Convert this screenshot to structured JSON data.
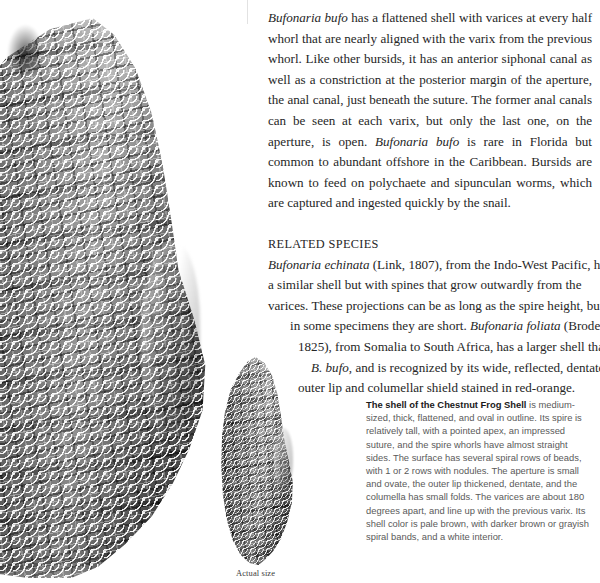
{
  "page": {
    "background_color": "#ffffff",
    "body_text_color": "#262626",
    "caption_text_color": "#5a5a5a",
    "caption_lead_color": "#1a1a1a"
  },
  "images": {
    "large_shell": {
      "name": "enlarged-shell-photograph",
      "subject": "Bufonaria bufo shell, enlarged grayscale photograph"
    },
    "small_shell": {
      "name": "actual-size-shell-photograph",
      "subject": "Bufonaria bufo shell at actual size, grayscale photograph"
    },
    "actual_size_label": "Actual size"
  },
  "body": {
    "paragraph_1": "Bufonaria bufo has a flattened shell with varices at every half whorl that are nearly aligned with the varix from the previous whorl. Like other bursids, it has an anterior siphonal canal as well as a constriction at the posterior margin of the aperture, the anal canal, just beneath the suture. The former anal canals can be seen at each varix, but only the last one, on the aperture, is open. Bufonaria bufo is rare in Florida but common to abundant offshore in the Caribbean. Bursids are known to feed on polychaete and sipunculan worms, which are captured and ingested quickly by the snail.",
    "section_heading": "RELATED SPECIES",
    "related_species_lines": [
      "Bufonaria echinata (Link, 1807), from the Indo-West Pacific, has",
      "a similar shell but with spines that grow outwardly from the",
      "varices. These projections can be as long as the spire height, but",
      "in some specimens they are short. Bufonaria foliata (Broderip,",
      "1825), from Somalia to South Africa, has a larger shell than",
      "B. bufo, and is recognized by its wide, reflected, dentate",
      "outer lip and columellar shield stained in red-orange."
    ],
    "italic_terms": [
      "Bufonaria bufo",
      "Bufonaria echinata",
      "Bufonaria foliata",
      "B. bufo"
    ]
  },
  "caption": {
    "lead": "The shell of the Chestnut Frog Shell",
    "text": " is medium-sized, thick, flattened, and oval in outline. Its spire is relatively tall, with a pointed apex, an impressed suture, and the spire whorls have almost straight sides. The surface has several spiral rows of beads, with 1 or 2 rows with nodules. The aperture is small and ovate, the outer lip thickened, dentate, and the columella has small folds. The varices are about 180 degrees apart, and line up with the previous varix. Its shell color is pale brown, with darker brown or grayish spiral bands, and a white interior."
  }
}
